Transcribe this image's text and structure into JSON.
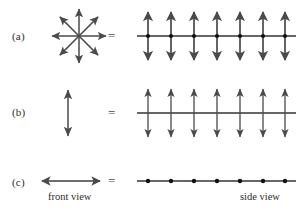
{
  "figure": {
    "width": 304,
    "height": 212,
    "background": "#ffffff",
    "stroke_color": "#4a4a4a",
    "dot_color": "#111111",
    "line_color": "#333333",
    "text_color": "#2b2b2b"
  },
  "rows": [
    {
      "id": "a",
      "label": "(a)",
      "label_x": 12,
      "label_y": 30,
      "equals": "=",
      "equals_x": 108,
      "equals_y": 28,
      "left_symbol": "radial-starburst-8-arrows",
      "right_symbol": "axis-line-with-vertical-double-arrows-and-dots",
      "axis_y": 36,
      "axis_x_start": 137,
      "axis_x_end": 296,
      "arrow_count": 7,
      "arrow_x_positions": [
        148,
        171,
        194,
        217,
        240,
        263,
        285
      ],
      "arrow_half_length": 25,
      "dots": true
    },
    {
      "id": "b",
      "label": "(b)",
      "label_x": 12,
      "label_y": 106,
      "equals": "=",
      "equals_x": 108,
      "equals_y": 104,
      "left_symbol": "single-vertical-double-arrow",
      "left_arrow_x": 68,
      "left_arrow_y_top": 90,
      "left_arrow_y_bottom": 136,
      "right_symbol": "axis-line-with-vertical-double-arrows",
      "axis_y": 113,
      "axis_x_start": 137,
      "axis_x_end": 296,
      "arrow_count": 7,
      "arrow_x_positions": [
        148,
        171,
        194,
        217,
        240,
        263,
        285
      ],
      "arrow_half_length": 25,
      "dots": false
    },
    {
      "id": "c",
      "label": "(c)",
      "label_x": 12,
      "label_y": 176,
      "equals": "=",
      "equals_x": 108,
      "equals_y": 174,
      "left_symbol": "single-horizontal-double-arrow",
      "left_arrow_y": 181,
      "left_arrow_x_start": 42,
      "left_arrow_x_end": 100,
      "right_symbol": "axis-line-with-dots",
      "axis_y": 181,
      "axis_x_start": 137,
      "axis_x_end": 296,
      "dot_count": 7,
      "dot_x_positions": [
        148,
        171,
        194,
        217,
        240,
        263,
        285
      ],
      "dots": true
    }
  ],
  "starburst": {
    "center_x": 79,
    "center_y": 36,
    "radius": 27,
    "arrow_count": 8,
    "angles_deg": [
      0,
      45,
      90,
      135,
      180,
      225,
      270,
      315
    ]
  },
  "captions": {
    "front_view": "front view",
    "front_view_x": 58,
    "front_view_y": 194,
    "side_view": "side view",
    "side_view_x": 246,
    "side_view_y": 194
  }
}
